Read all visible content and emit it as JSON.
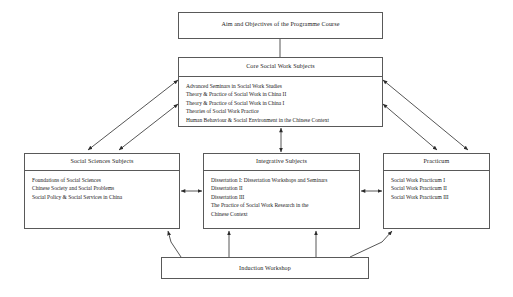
{
  "diagram": {
    "title_box": {
      "label": "Aim and Objectives of the Programme Course"
    },
    "core": {
      "title": "Core Social Work Subjects",
      "items": [
        "Advanced Seminars in Social Work Studies",
        "Theory & Practice of Social Work in China II",
        "Theory & Practice of Social Work in China I",
        "Theories of Social Work Practice",
        "Human Behaviour & Social Environment in the Chinese Context"
      ]
    },
    "social_sciences": {
      "title": "Social Sciences Subjects",
      "items": [
        "Foundations of Social Sciences",
        "Chinese Society and Social Problems",
        "Social Policy & Social Services in China"
      ]
    },
    "integrative": {
      "title": "Integrative Subjects",
      "items": [
        "Dissertation I: Dissertation Workshops and Seminars",
        "Dissertation II",
        "Dissertation III",
        "The Practice of Social Work Research in the",
        "Chinese Context"
      ]
    },
    "practicum": {
      "title": "Practicum",
      "items": [
        "Social Work Practicum I",
        "Social Work Practicum II",
        "Social Work Practicum III"
      ]
    },
    "induction": {
      "label": "Induction Workshop"
    },
    "colors": {
      "border": "#595959",
      "text": "#1a1a1a",
      "background": "#ffffff",
      "connector": "#2b2b2b"
    }
  }
}
